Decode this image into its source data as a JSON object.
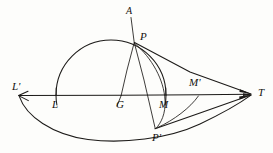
{
  "figure": {
    "kind": "geometry-diagram",
    "background_color": "#fdfdfb",
    "ink_color": "#1c1a18",
    "labels": [
      {
        "id": "A",
        "text": "A",
        "x": 126,
        "y": 6,
        "size": "small"
      },
      {
        "id": "P",
        "text": "P",
        "x": 140,
        "y": 32,
        "size": "normal"
      },
      {
        "id": "L-prime",
        "text": "L'",
        "x": 12,
        "y": 82,
        "size": "normal"
      },
      {
        "id": "M-prime",
        "text": "M'",
        "x": 189,
        "y": 78,
        "size": "normal"
      },
      {
        "id": "T",
        "text": "T",
        "x": 258,
        "y": 88,
        "size": "normal"
      },
      {
        "id": "L",
        "text": "L",
        "x": 52,
        "y": 100,
        "size": "normal"
      },
      {
        "id": "G",
        "text": "G",
        "x": 116,
        "y": 100,
        "size": "normal"
      },
      {
        "id": "M",
        "text": "M",
        "x": 159,
        "y": 100,
        "size": "normal"
      },
      {
        "id": "P-prime",
        "text": "P'",
        "x": 152,
        "y": 133,
        "size": "normal"
      }
    ],
    "points": {
      "A": {
        "x": 130,
        "y": 18
      },
      "P": {
        "x": 134,
        "y": 42
      },
      "L_prime": {
        "x": 18,
        "y": 96
      },
      "L": {
        "x": 56,
        "y": 95
      },
      "G": {
        "x": 121,
        "y": 95
      },
      "M": {
        "x": 166,
        "y": 95
      },
      "M_prime": {
        "x": 198,
        "y": 95
      },
      "T": {
        "x": 252,
        "y": 94
      },
      "P_prime": {
        "x": 156,
        "y": 128
      }
    },
    "circle": {
      "cx": 111,
      "cy": 95,
      "r": 55
    },
    "strokes": [
      "axis-line-Lprime-to-T",
      "main-circle",
      "lower-arc-Lprime-to-Pprime-to-T",
      "chord-P-to-T",
      "chord-Pprime-to-T",
      "line-A-through-P-to-Pprime",
      "line-P-to-G",
      "arc-P-to-Pprime"
    ]
  }
}
